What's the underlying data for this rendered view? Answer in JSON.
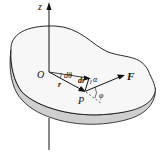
{
  "diagram": {
    "labels": {
      "z_axis": "z",
      "origin": "O",
      "point": "P",
      "force": "F",
      "position_vector": "r",
      "displacement": "dr",
      "angle_dtheta": "dθ",
      "angle_alpha": "α",
      "angle_phi": "φ"
    },
    "colors": {
      "line": "#111111",
      "body_top": "#f4f4f4",
      "body_side": "#cfcfcf"
    }
  }
}
